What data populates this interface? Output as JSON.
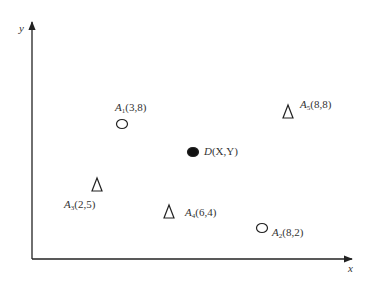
{
  "axes": {
    "x_label": "x",
    "y_label": "y"
  },
  "points": [
    {
      "name": "A",
      "sub": "1",
      "coords": "(3,8)",
      "marker": "circle-open",
      "px": 122,
      "py": 124,
      "lx": 115,
      "ly": 102
    },
    {
      "name": "A",
      "sub": "2",
      "coords": "(8,2)",
      "marker": "circle-open",
      "px": 262,
      "py": 228,
      "lx": 272,
      "ly": 227
    },
    {
      "name": "A",
      "sub": "3",
      "coords": "(2,5)",
      "marker": "triangle-open",
      "px": 97,
      "py": 185,
      "lx": 64,
      "ly": 199
    },
    {
      "name": "A",
      "sub": "4",
      "coords": "(6,4)",
      "marker": "triangle-open",
      "px": 169,
      "py": 212,
      "lx": 185,
      "ly": 207
    },
    {
      "name": "A",
      "sub": "5",
      "coords": "(8,8)",
      "marker": "triangle-open",
      "px": 288,
      "py": 112,
      "lx": 300,
      "ly": 99
    },
    {
      "name": "D",
      "sub": "",
      "coords": "(X,Y)",
      "marker": "circle-filled",
      "px": 193,
      "py": 152,
      "lx": 204,
      "ly": 146
    }
  ],
  "chart_data": {
    "type": "scatter",
    "title": "",
    "xlabel": "x",
    "ylabel": "y",
    "grid": false,
    "series": [
      {
        "name": "circles (open)",
        "points": [
          {
            "label": "A1",
            "x": 3,
            "y": 8
          },
          {
            "label": "A2",
            "x": 8,
            "y": 2
          }
        ]
      },
      {
        "name": "triangles (open)",
        "points": [
          {
            "label": "A3",
            "x": 2,
            "y": 5
          },
          {
            "label": "A4",
            "x": 6,
            "y": 4
          },
          {
            "label": "A5",
            "x": 8,
            "y": 8
          }
        ]
      },
      {
        "name": "query point (filled)",
        "points": [
          {
            "label": "D",
            "x": "X",
            "y": "Y"
          }
        ]
      }
    ],
    "annotations": [
      "A1(3,8)",
      "A2(8,2)",
      "A3(2,5)",
      "A4(6,4)",
      "A5(8,8)",
      "D(X,Y)"
    ]
  }
}
